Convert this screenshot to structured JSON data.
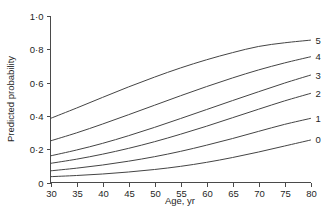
{
  "chart_data": {
    "type": "line",
    "title": "",
    "xlabel": "Age, yr",
    "ylabel": "Predicted probability",
    "xlim": [
      30,
      80
    ],
    "ylim": [
      0,
      1.0
    ],
    "grid": false,
    "legend_position": "right-end-of-line",
    "x_tick_labels": [
      "30",
      "35",
      "40",
      "45",
      "50",
      "55",
      "60",
      "65",
      "70",
      "75",
      "80"
    ],
    "x_ticks": [
      30,
      35,
      40,
      45,
      50,
      55,
      60,
      65,
      70,
      75,
      80
    ],
    "y_tick_labels": [
      "1·0",
      "0·8",
      "0·6",
      "0·4",
      "0·2",
      "0"
    ],
    "y_ticks": [
      1.0,
      0.8,
      0.6,
      0.4,
      0.2,
      0
    ],
    "x": [
      30,
      35,
      40,
      45,
      50,
      55,
      60,
      65,
      70,
      75,
      80
    ],
    "series": [
      {
        "name": "5",
        "label": "5",
        "values": [
          0.385,
          0.447,
          0.511,
          0.574,
          0.633,
          0.688,
          0.737,
          0.78,
          0.817,
          0.839,
          0.855
        ]
      },
      {
        "name": "4",
        "label": "4",
        "values": [
          0.25,
          0.298,
          0.351,
          0.407,
          0.464,
          0.521,
          0.576,
          0.628,
          0.676,
          0.718,
          0.755
        ]
      },
      {
        "name": "3",
        "label": "3",
        "values": [
          0.16,
          0.195,
          0.235,
          0.281,
          0.331,
          0.384,
          0.438,
          0.492,
          0.545,
          0.597,
          0.645
        ]
      },
      {
        "name": "2",
        "label": "2",
        "values": [
          0.115,
          0.14,
          0.17,
          0.205,
          0.245,
          0.29,
          0.338,
          0.389,
          0.44,
          0.49,
          0.535
        ]
      },
      {
        "name": "1",
        "label": "1",
        "values": [
          0.07,
          0.086,
          0.105,
          0.128,
          0.155,
          0.187,
          0.224,
          0.264,
          0.307,
          0.349,
          0.385
        ]
      },
      {
        "name": "0",
        "label": "0",
        "values": [
          0.035,
          0.042,
          0.051,
          0.063,
          0.078,
          0.097,
          0.121,
          0.15,
          0.183,
          0.219,
          0.255
        ]
      }
    ],
    "colors": {
      "curve": "#444444",
      "axis": "#4a4a4a",
      "text": "#1f1f1f",
      "background": "#ffffff"
    }
  }
}
